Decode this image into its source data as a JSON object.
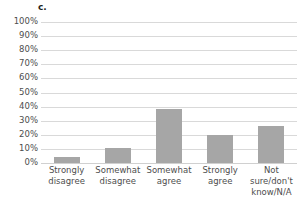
{
  "figure": {
    "panel_letter": "c."
  },
  "chart_data": {
    "type": "bar",
    "title": "",
    "subtitle": "",
    "xlabel": "",
    "ylabel": "",
    "categories": [
      "Strongly disagree",
      "Somewhat disagree",
      "Somewhat agree",
      "Strongly agree",
      "Not sure/don't know/N/A"
    ],
    "category_lines": [
      [
        "Strongly",
        "disagree"
      ],
      [
        "Somewhat",
        "disagree"
      ],
      [
        "Somewhat",
        "agree"
      ],
      [
        "Strongly",
        "agree"
      ],
      [
        "Not sure/don't",
        "know/N/A"
      ]
    ],
    "values": [
      4,
      11,
      38,
      20,
      26
    ],
    "ylim": [
      0,
      100
    ],
    "ytick_values": [
      0,
      10,
      20,
      30,
      40,
      50,
      60,
      70,
      80,
      90,
      100
    ],
    "ytick_labels": [
      "0%",
      "10%",
      "20%",
      "30%",
      "40%",
      "50%",
      "60%",
      "70%",
      "80%",
      "90%",
      "100%"
    ],
    "grid": true,
    "legend": false,
    "legend_position": "none",
    "bar_color": "#a6a6a6",
    "gridline_color": "#d9d9d9",
    "background_color": "#ffffff",
    "text_color": "#4d4d4d"
  }
}
